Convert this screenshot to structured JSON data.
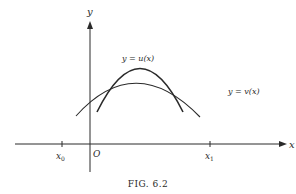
{
  "figure": {
    "caption": "FIG. 6.2",
    "axes": {
      "x_label": "x",
      "y_label": "y",
      "origin_label": "O",
      "ticks": [
        {
          "name": "x0",
          "base": "x",
          "sub": "0"
        },
        {
          "name": "x1",
          "base": "x",
          "sub": "1"
        }
      ]
    },
    "curves": [
      {
        "name": "u",
        "label": "y = u(x)",
        "description": "narrow, taller concave-down arch"
      },
      {
        "name": "v",
        "label": "y = v(x)",
        "description": "wider, flatter concave-down arch"
      }
    ],
    "colors": {
      "ink": "#2a2a2a",
      "background": "#ffffff"
    }
  }
}
